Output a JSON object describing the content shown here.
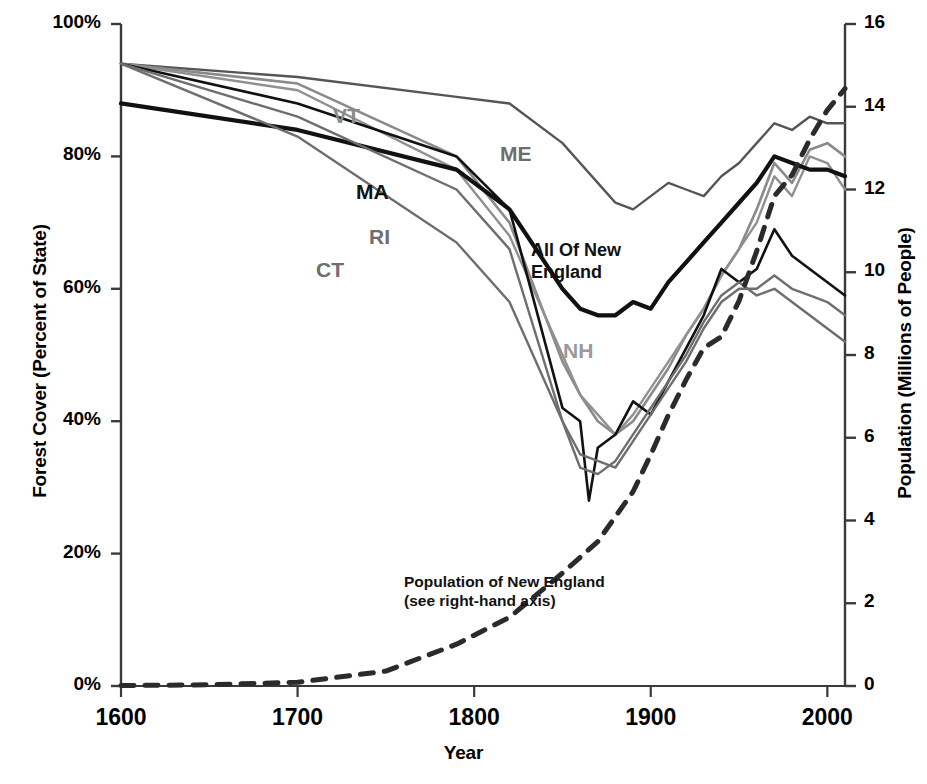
{
  "chart_data": {
    "type": "line",
    "title": "",
    "xlabel": "Year",
    "ylabel": "Forest Cover (Percent of State)",
    "ylabel_right": "Population (Millions of People)",
    "xlim": [
      1600,
      2010
    ],
    "ylim": [
      0,
      100
    ],
    "ylim_right": [
      0,
      16
    ],
    "grid": false,
    "legend": "inline data labels",
    "xticks": [
      "1600",
      "1700",
      "1800",
      "1900",
      "2000"
    ],
    "xtick_values": [
      1600,
      1700,
      1800,
      1900,
      2000
    ],
    "yticks_left": [
      "0%",
      "20%",
      "40%",
      "60%",
      "80%",
      "100%"
    ],
    "ytick_values_left": [
      0,
      20,
      40,
      60,
      80,
      100
    ],
    "yticks_right": [
      "0",
      "2",
      "4",
      "6",
      "8",
      "10",
      "12",
      "14",
      "16"
    ],
    "ytick_values_right": [
      0,
      2,
      4,
      6,
      8,
      10,
      12,
      14,
      16
    ],
    "annotations": [
      {
        "name": "population-note",
        "line1": "Population of New England",
        "line2": "(see right-hand axis)"
      }
    ],
    "series": [
      {
        "name": "ME",
        "label": "ME",
        "color": "#555555",
        "width": 2.4,
        "axis": "left",
        "x": [
          1600,
          1700,
          1790,
          1820,
          1850,
          1860,
          1870,
          1880,
          1890,
          1900,
          1910,
          1920,
          1930,
          1940,
          1950,
          1960,
          1970,
          1980,
          1990,
          2000,
          2010
        ],
        "values": [
          94,
          92,
          89,
          88,
          82,
          79,
          76,
          73,
          72,
          74,
          76,
          75,
          74,
          77,
          79,
          82,
          85,
          84,
          86,
          85,
          85
        ]
      },
      {
        "name": "VT",
        "label": "VT",
        "color": "#8a8a8a",
        "width": 2.6,
        "axis": "left",
        "x": [
          1600,
          1700,
          1790,
          1820,
          1850,
          1860,
          1870,
          1880,
          1890,
          1900,
          1910,
          1920,
          1930,
          1940,
          1950,
          1960,
          1970,
          1980,
          1990,
          2000,
          2010
        ],
        "values": [
          94,
          91,
          80,
          70,
          49,
          44,
          40,
          38,
          40,
          44,
          48,
          53,
          57,
          62,
          66,
          72,
          79,
          76,
          81,
          82,
          80
        ]
      },
      {
        "name": "NH",
        "label": "NH",
        "color": "#909090",
        "width": 2.4,
        "axis": "left",
        "x": [
          1600,
          1700,
          1790,
          1820,
          1850,
          1860,
          1870,
          1880,
          1890,
          1900,
          1910,
          1920,
          1930,
          1940,
          1950,
          1960,
          1970,
          1980,
          1990,
          2000,
          2010
        ],
        "values": [
          94,
          90,
          78,
          68,
          50,
          44,
          41,
          38,
          41,
          45,
          49,
          53,
          57,
          62,
          66,
          70,
          77,
          74,
          80,
          79,
          75
        ]
      },
      {
        "name": "All Of New England",
        "label": "All  Of New England",
        "color": "#111111",
        "width": 4.2,
        "axis": "left",
        "x": [
          1600,
          1700,
          1790,
          1820,
          1850,
          1860,
          1870,
          1880,
          1890,
          1900,
          1910,
          1920,
          1930,
          1940,
          1950,
          1960,
          1970,
          1980,
          1990,
          2000,
          2010
        ],
        "values": [
          88,
          84,
          78,
          72,
          60,
          57,
          56,
          56,
          58,
          57,
          61,
          64,
          67,
          70,
          73,
          76,
          80,
          79,
          78,
          78,
          77
        ]
      },
      {
        "name": "MA",
        "label": "MA",
        "color": "#111111",
        "width": 2.6,
        "axis": "left",
        "x": [
          1600,
          1700,
          1790,
          1820,
          1850,
          1860,
          1865,
          1870,
          1880,
          1890,
          1900,
          1910,
          1920,
          1930,
          1940,
          1950,
          1960,
          1970,
          1980,
          1990,
          2000,
          2010
        ],
        "values": [
          94,
          88,
          80,
          72,
          42,
          40,
          28,
          36,
          38,
          43,
          41,
          46,
          51,
          56,
          63,
          61,
          63,
          69,
          65,
          63,
          61,
          59
        ]
      },
      {
        "name": "RI",
        "label": "RI",
        "color": "#6e6e6e",
        "width": 2.4,
        "axis": "left",
        "x": [
          1600,
          1700,
          1790,
          1820,
          1850,
          1860,
          1870,
          1880,
          1890,
          1900,
          1910,
          1920,
          1930,
          1940,
          1950,
          1960,
          1970,
          1980,
          1990,
          2000,
          2010
        ],
        "values": [
          94,
          86,
          75,
          66,
          40,
          35,
          34,
          33,
          37,
          41,
          45,
          49,
          54,
          58,
          60,
          60,
          62,
          60,
          59,
          58,
          56
        ]
      },
      {
        "name": "CT",
        "label": "CT",
        "color": "#6e6e6e",
        "width": 2.4,
        "axis": "left",
        "x": [
          1600,
          1700,
          1790,
          1820,
          1850,
          1860,
          1870,
          1880,
          1890,
          1900,
          1910,
          1920,
          1930,
          1940,
          1950,
          1960,
          1970,
          1980,
          1990,
          2000,
          2010
        ],
        "values": [
          94,
          83,
          67,
          58,
          40,
          33,
          32,
          34,
          38,
          42,
          46,
          50,
          55,
          59,
          61,
          59,
          60,
          58,
          56,
          54,
          52
        ]
      },
      {
        "name": "Population of New England",
        "label": "Population of New England",
        "color": "#2b2b2b",
        "width": 5,
        "dashed": true,
        "axis": "right",
        "x": [
          1600,
          1650,
          1700,
          1750,
          1790,
          1820,
          1850,
          1870,
          1890,
          1900,
          1910,
          1920,
          1930,
          1940,
          1950,
          1960,
          1970,
          1980,
          1990,
          2000,
          2010
        ],
        "values": [
          0.01,
          0.03,
          0.09,
          0.36,
          1.01,
          1.66,
          2.73,
          3.49,
          4.7,
          5.59,
          6.55,
          7.4,
          8.17,
          8.44,
          9.31,
          10.51,
          11.84,
          12.35,
          13.21,
          13.92,
          14.44
        ]
      }
    ]
  },
  "labels": {
    "vt": "VT",
    "me": "ME",
    "ma": "MA",
    "ri": "RI",
    "ct": "CT",
    "nh": "NH",
    "all_ne_line1": "All  Of New",
    "all_ne_line2": "England",
    "pop_line1": "Population of New England",
    "pop_line2": "(see right-hand axis)"
  }
}
